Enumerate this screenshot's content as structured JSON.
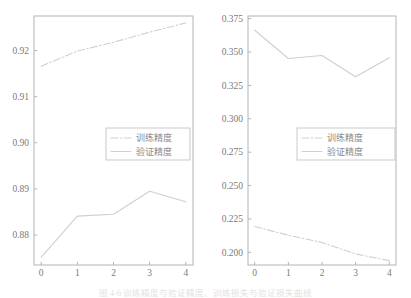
{
  "figure": {
    "caption": "图 4-6  训练精度与验证精度、训练损失与验证损失曲线"
  },
  "chart_data": [
    {
      "type": "line",
      "title": "",
      "xlabel": "",
      "ylabel": "",
      "x": [
        0,
        1,
        2,
        3,
        4
      ],
      "xticks": [
        "0",
        "1",
        "2",
        "3",
        "4"
      ],
      "yticks": [
        "0.88",
        "0.89",
        "0.90",
        "0.91",
        "0.92"
      ],
      "ytick_values": [
        0.88,
        0.89,
        0.9,
        0.91,
        0.92
      ],
      "xlim": [
        -0.2,
        4.2
      ],
      "ylim": [
        0.8735,
        0.9275
      ],
      "grid": false,
      "legend_position": "center",
      "series": [
        {
          "name": "训练精度",
          "style": "dash-dot",
          "color": "#cfcfcf",
          "values": [
            0.9166,
            0.9199,
            0.9218,
            0.924,
            0.926
          ]
        },
        {
          "name": "验证精度",
          "style": "solid",
          "color": "#cfcfcf",
          "values": [
            0.8752,
            0.8841,
            0.8845,
            0.8895,
            0.8872
          ]
        }
      ]
    },
    {
      "type": "line",
      "title": "",
      "xlabel": "",
      "ylabel": "",
      "x": [
        0,
        1,
        2,
        3,
        4
      ],
      "xticks": [
        "0",
        "1",
        "2",
        "3",
        "4"
      ],
      "yticks": [
        "0.200",
        "0.225",
        "0.250",
        "0.275",
        "0.300",
        "0.325",
        "0.350",
        "0.375"
      ],
      "ytick_values": [
        0.2,
        0.225,
        0.25,
        0.275,
        0.3,
        0.325,
        0.35,
        0.375
      ],
      "xlim": [
        -0.2,
        4.2
      ],
      "ylim": [
        0.1905,
        0.377
      ],
      "grid": false,
      "legend_position": "center",
      "series": [
        {
          "name": "训练精度",
          "style": "dash-dot",
          "color": "#cfcfcf",
          "values": [
            0.2193,
            0.2128,
            0.2073,
            0.1988,
            0.1938
          ]
        },
        {
          "name": "验证精度",
          "style": "solid",
          "color": "#cfcfcf",
          "values": [
            0.3663,
            0.3452,
            0.3474,
            0.3315,
            0.3457
          ]
        }
      ]
    }
  ],
  "colors": {
    "line": "#cfcfcf",
    "axis": "#b4b4b4",
    "tick_text": "#7a7a7a",
    "legend_text": "#8a8a8a"
  }
}
